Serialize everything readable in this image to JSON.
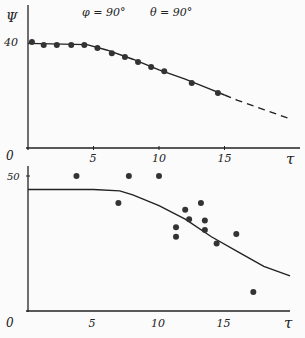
{
  "chart_data": [
    {
      "type": "line",
      "title": "φ = 90°   θ = 90°",
      "annotation_phi": "φ = 90°",
      "annotation_theta": "θ = 90°",
      "xlabel": "τ",
      "ylabel": "Ψ",
      "xticks": [
        "0",
        "5",
        "10",
        "15"
      ],
      "yticks": [
        "0",
        "40"
      ],
      "xlim": [
        0,
        20
      ],
      "ylim": [
        0,
        48
      ],
      "series": [
        {
          "name": "measured",
          "style": "markers",
          "x": [
            0.3,
            1.2,
            2.2,
            3.3,
            4.3,
            5.3,
            6.4,
            7.4,
            8.4,
            9.4,
            10.4,
            12.5,
            14.5
          ],
          "y": [
            40,
            38.9,
            38.9,
            38.9,
            38.9,
            37.7,
            35.8,
            34.3,
            32.5,
            30.6,
            29,
            24.5,
            20.8
          ]
        },
        {
          "name": "theory",
          "style": "solid then dashed beyond 15",
          "x": [
            0,
            4.5,
            6,
            8,
            10,
            12,
            14,
            15,
            16,
            18,
            20
          ],
          "y": [
            39.5,
            39,
            37,
            33.5,
            29.5,
            26,
            22,
            20,
            18,
            14.5,
            11
          ]
        }
      ]
    },
    {
      "type": "scatter",
      "xlabel": "τ",
      "ylabel": "",
      "xticks": [
        "0",
        "5",
        "10",
        "15"
      ],
      "yticks": [
        "50"
      ],
      "xlim": [
        0,
        20
      ],
      "ylim": [
        0,
        55
      ],
      "series": [
        {
          "name": "measured",
          "style": "markers",
          "x": [
            3.7,
            6.9,
            7.7,
            10.0,
            11.3,
            11.3,
            12.0,
            12.3,
            13.2,
            13.5,
            13.5,
            14.4,
            15.9,
            17.2
          ],
          "y": [
            50,
            40,
            50,
            50,
            31,
            27.5,
            37.5,
            34,
            40,
            33.5,
            30,
            25,
            28.5,
            7
          ]
        },
        {
          "name": "theory",
          "style": "solid",
          "x": [
            0,
            5,
            7,
            8,
            10,
            12,
            14,
            16,
            18,
            20
          ],
          "y": [
            45,
            45,
            44.5,
            43,
            39,
            34,
            27.5,
            22,
            16.5,
            13
          ]
        }
      ]
    }
  ]
}
